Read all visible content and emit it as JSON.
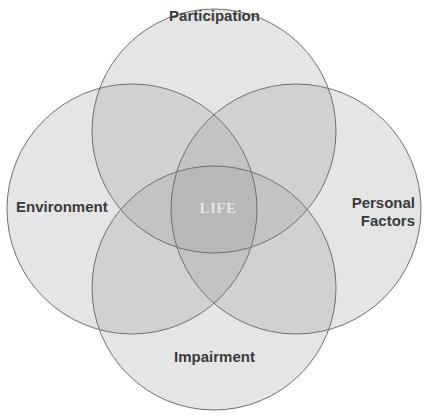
{
  "diagram": {
    "type": "venn",
    "circles": [
      {
        "id": "participation",
        "label": "Participation",
        "cx": 214,
        "cy": 131,
        "r": 122
      },
      {
        "id": "environment",
        "label": "Environment",
        "cx": 132,
        "cy": 209,
        "r": 125
      },
      {
        "id": "personal-factors",
        "label": "Personal\nFactors",
        "cx": 296,
        "cy": 209,
        "r": 125
      },
      {
        "id": "impairment",
        "label": "Impairment",
        "cx": 214,
        "cy": 288,
        "r": 122
      }
    ],
    "center_label": "LIFE",
    "colors": {
      "single_region": "#e6e6e6",
      "double_overlap": "#c6c6c6",
      "triple_overlap": "#b0b0b0",
      "center_overlap": "#9a9a9a",
      "stroke": "#6f6f6f",
      "label_text": "#3a3a3a",
      "center_text": "#e4e4e4"
    }
  },
  "labels": {
    "participation": "Participation",
    "environment": "Environment",
    "personal_line1": "Personal",
    "personal_line2": "Factors",
    "impairment": "Impairment",
    "life": "LIFE"
  }
}
